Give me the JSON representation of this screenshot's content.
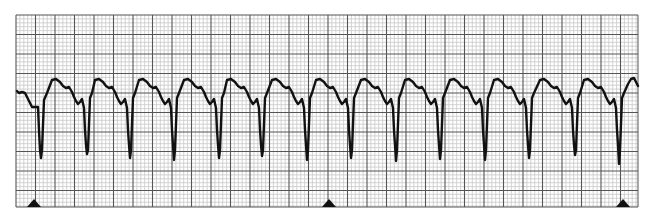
{
  "chart_data": {
    "type": "line",
    "title": "",
    "xlabel": "",
    "ylabel": "",
    "grid": true,
    "grid_area": {
      "x0": 16,
      "y0": 15,
      "x1": 638,
      "y1": 207
    },
    "grid_minor_px": 3.9,
    "grid_major_px": 19.45,
    "colors": {
      "background": "#ffffff",
      "minor_grid": "#c8c8c8",
      "major_grid": "#555555",
      "trace": "#111111",
      "marker": "#111111"
    },
    "beat_trough_x": [
      41,
      87,
      130,
      174,
      219,
      262,
      307,
      351,
      396,
      440,
      485,
      529,
      575,
      619
    ],
    "beat_period_px": 44.5,
    "marker_x": [
      34,
      329,
      623
    ],
    "trace_start": [
      17,
      91
    ],
    "trace_end": [
      638,
      86
    ]
  }
}
